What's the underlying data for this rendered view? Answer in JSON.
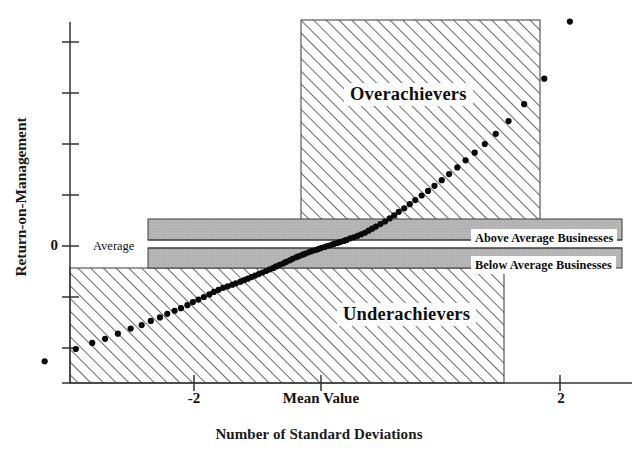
{
  "chart_data": {
    "type": "scatter",
    "title": "",
    "subtitle": "",
    "xlabel": "Number of Standard Deviations",
    "ylabel": "Return-on-Management",
    "x_axis": {
      "ticks": [
        -3,
        -2,
        -1,
        0,
        1,
        2,
        3
      ],
      "tick_labels": [
        "",
        "-2",
        "",
        "Mean Value",
        "",
        "2",
        ""
      ],
      "xlim": [
        -3.35,
        2.9
      ],
      "grid": false
    },
    "y_axis": {
      "ticks": [
        -2,
        -1,
        0,
        1,
        2,
        3,
        4,
        5
      ],
      "tick_labels": [
        "",
        "",
        "0",
        "",
        "",
        "",
        "",
        ""
      ],
      "ylim": [
        -2.6,
        5.2
      ],
      "grid": false
    },
    "legend": {
      "position": "none",
      "entries": []
    },
    "annotations": [
      {
        "name": "overachievers-region",
        "text": "Overachievers",
        "fill": "diagonal-hatch",
        "x_range": [
          -0.05,
          2.55
        ],
        "y_range": [
          0.23,
          5.2
        ]
      },
      {
        "name": "underachievers-region",
        "text": "Underachievers",
        "fill": "diagonal-hatch",
        "x_range": [
          -3.35,
          1.65
        ],
        "y_range": [
          -2.6,
          -0.07
        ]
      },
      {
        "name": "above-average-band",
        "text": "Above Average Businesses",
        "fill": "gray",
        "x_range": [
          -2.32,
          2.88
        ],
        "y_range": [
          0.06,
          0.23
        ]
      },
      {
        "name": "below-average-band",
        "text": "Below Average Businesses",
        "fill": "gray",
        "x_range": [
          -2.32,
          2.88
        ],
        "y_range": [
          -0.07,
          0.015
        ]
      },
      {
        "name": "average-line",
        "text": "Average",
        "y_value": 0
      }
    ],
    "series": [
      {
        "name": "Return-on-Management percentile points",
        "marker": "filled-circle",
        "color": "#0a0a0a",
        "points": [
          [
            -3.02,
            -2.26
          ],
          [
            -2.68,
            -2.02
          ],
          [
            -2.5,
            -1.9
          ],
          [
            -2.36,
            -1.82
          ],
          [
            -2.22,
            -1.72
          ],
          [
            -2.08,
            -1.62
          ],
          [
            -1.96,
            -1.55
          ],
          [
            -1.86,
            -1.47
          ],
          [
            -1.76,
            -1.4
          ],
          [
            -1.68,
            -1.33
          ],
          [
            -1.6,
            -1.27
          ],
          [
            -1.53,
            -1.22
          ],
          [
            -1.46,
            -1.16
          ],
          [
            -1.4,
            -1.1
          ],
          [
            -1.34,
            -1.05
          ],
          [
            -1.28,
            -1.0
          ],
          [
            -1.22,
            -0.95
          ],
          [
            -1.17,
            -0.9
          ],
          [
            -1.12,
            -0.86
          ],
          [
            -1.07,
            -0.82
          ],
          [
            -1.02,
            -0.79
          ],
          [
            -0.97,
            -0.76
          ],
          [
            -0.93,
            -0.73
          ],
          [
            -0.88,
            -0.7
          ],
          [
            -0.84,
            -0.67
          ],
          [
            -0.8,
            -0.64
          ],
          [
            -0.76,
            -0.61
          ],
          [
            -0.72,
            -0.58
          ],
          [
            -0.68,
            -0.55
          ],
          [
            -0.64,
            -0.52
          ],
          [
            -0.6,
            -0.49
          ],
          [
            -0.56,
            -0.46
          ],
          [
            -0.52,
            -0.43
          ],
          [
            -0.49,
            -0.4
          ],
          [
            -0.45,
            -0.37
          ],
          [
            -0.41,
            -0.34
          ],
          [
            -0.38,
            -0.31
          ],
          [
            -0.34,
            -0.28
          ],
          [
            -0.31,
            -0.25
          ],
          [
            -0.27,
            -0.22
          ],
          [
            -0.24,
            -0.2
          ],
          [
            -0.2,
            -0.17
          ],
          [
            -0.17,
            -0.15
          ],
          [
            -0.13,
            -0.12
          ],
          [
            -0.1,
            -0.1
          ],
          [
            -0.06,
            -0.08
          ],
          [
            -0.03,
            -0.06
          ],
          [
            0.0,
            -0.04
          ],
          [
            0.04,
            -0.02
          ],
          [
            0.07,
            0.0
          ],
          [
            0.11,
            0.02
          ],
          [
            0.14,
            0.04
          ],
          [
            0.18,
            0.06
          ],
          [
            0.21,
            0.08
          ],
          [
            0.25,
            0.1
          ],
          [
            0.28,
            0.12
          ],
          [
            0.32,
            0.15
          ],
          [
            0.36,
            0.17
          ],
          [
            0.4,
            0.2
          ],
          [
            0.44,
            0.23
          ],
          [
            0.48,
            0.26
          ],
          [
            0.52,
            0.3
          ],
          [
            0.56,
            0.34
          ],
          [
            0.6,
            0.38
          ],
          [
            0.65,
            0.43
          ],
          [
            0.7,
            0.48
          ],
          [
            0.75,
            0.54
          ],
          [
            0.8,
            0.6
          ],
          [
            0.85,
            0.67
          ],
          [
            0.91,
            0.74
          ],
          [
            0.97,
            0.82
          ],
          [
            1.03,
            0.9
          ],
          [
            1.1,
            0.99
          ],
          [
            1.17,
            1.08
          ],
          [
            1.24,
            1.18
          ],
          [
            1.32,
            1.29
          ],
          [
            1.4,
            1.41
          ],
          [
            1.49,
            1.54
          ],
          [
            1.58,
            1.68
          ],
          [
            1.68,
            1.83
          ],
          [
            1.79,
            2.0
          ],
          [
            1.91,
            2.2
          ],
          [
            2.05,
            2.45
          ],
          [
            2.22,
            2.78
          ],
          [
            2.44,
            3.28
          ],
          [
            2.72,
            4.4
          ]
        ]
      }
    ]
  },
  "figure": {
    "y_axis_title": "Return-on-Management",
    "x_axis_title": "Number of Standard Deviations",
    "y_tick_zero": "0",
    "x_tick_neg2": "-2",
    "x_tick_mean": "Mean Value",
    "x_tick_pos2": "2",
    "label_overachievers": "Overachievers",
    "label_underachievers": "Underachievers",
    "label_average": "Average",
    "label_above_average": "Above Average Businesses",
    "label_below_average": "Below Average Businesses"
  },
  "colors": {
    "ink": "#111111",
    "hatch_line": "#6e6e6e",
    "band_gray": "#b4b4b4",
    "marker": "#0a0a0a",
    "background": "#ffffff"
  }
}
